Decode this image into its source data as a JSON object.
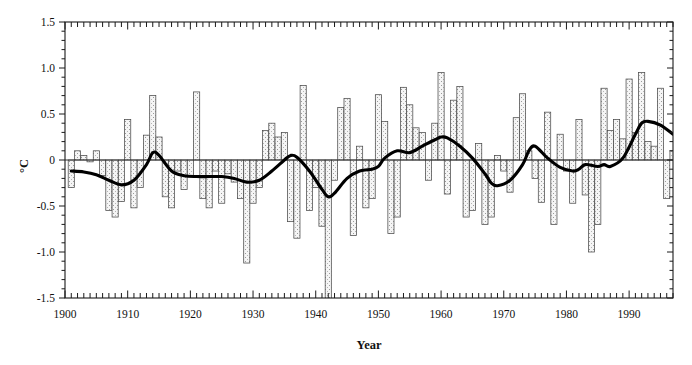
{
  "chart_data": {
    "type": "bar",
    "title": "",
    "subtitle": "",
    "xlabel": "Year",
    "ylabel": "°C",
    "xlim": [
      1900,
      1997
    ],
    "ylim": [
      -1.5,
      1.5
    ],
    "ytick_values": [
      -1.5,
      -1.0,
      -0.5,
      0,
      0.5,
      1.0,
      1.5
    ],
    "ytick_labels": [
      "-1.5",
      "-1.0",
      "-0.5",
      "0",
      "0.5",
      "1.0",
      "1.5"
    ],
    "xtick_values": [
      1900,
      1910,
      1920,
      1930,
      1940,
      1950,
      1960,
      1970,
      1980,
      1990
    ],
    "xtick_labels": [
      "1900",
      "1910",
      "1920",
      "1930",
      "1940",
      "1950",
      "1960",
      "1970",
      "1980",
      "1990"
    ],
    "minor_x_tick_interval": 1,
    "minor_y_tick_interval": 0.1,
    "grid": false,
    "legend": null,
    "zero_reference_line": 0,
    "bar_fill": "#f2f2f2",
    "bar_stipple": "#8a8a8a",
    "bar_edge": "#4a4a4a",
    "smooth_line_color": "#000000",
    "categories": [
      1901,
      1902,
      1903,
      1904,
      1905,
      1906,
      1907,
      1908,
      1909,
      1910,
      1911,
      1912,
      1913,
      1914,
      1915,
      1916,
      1917,
      1918,
      1919,
      1920,
      1921,
      1922,
      1923,
      1924,
      1925,
      1926,
      1927,
      1928,
      1929,
      1930,
      1931,
      1932,
      1933,
      1934,
      1935,
      1936,
      1937,
      1938,
      1939,
      1940,
      1941,
      1942,
      1943,
      1944,
      1945,
      1946,
      1947,
      1948,
      1949,
      1950,
      1951,
      1952,
      1953,
      1954,
      1955,
      1956,
      1957,
      1958,
      1959,
      1960,
      1961,
      1962,
      1963,
      1964,
      1965,
      1966,
      1967,
      1968,
      1969,
      1970,
      1971,
      1972,
      1973,
      1974,
      1975,
      1976,
      1977,
      1978,
      1979,
      1980,
      1981,
      1982,
      1983,
      1984,
      1985,
      1986,
      1987,
      1988,
      1989,
      1990,
      1991,
      1992,
      1993,
      1994,
      1995,
      1996,
      1997
    ],
    "values": [
      -0.3,
      0.1,
      0.05,
      -0.02,
      0.1,
      -0.17,
      -0.55,
      -0.62,
      -0.45,
      0.44,
      -0.52,
      -0.3,
      0.27,
      0.7,
      0.25,
      -0.4,
      -0.52,
      -0.12,
      -0.32,
      -0.17,
      0.74,
      -0.42,
      -0.52,
      -0.12,
      -0.47,
      -0.15,
      -0.24,
      -0.42,
      -1.12,
      -0.47,
      -0.3,
      0.32,
      0.4,
      0.25,
      0.3,
      -0.67,
      -0.85,
      0.81,
      -0.55,
      -0.3,
      -0.72,
      -1.62,
      -0.22,
      0.57,
      0.67,
      -0.82,
      0.15,
      -0.52,
      -0.42,
      0.71,
      0.42,
      -0.8,
      -0.62,
      0.79,
      0.6,
      0.35,
      0.3,
      -0.22,
      0.4,
      0.95,
      -0.37,
      0.65,
      0.8,
      -0.62,
      -0.55,
      0.18,
      -0.7,
      -0.62,
      0.05,
      -0.12,
      -0.35,
      0.46,
      0.72,
      0.1,
      -0.2,
      -0.46,
      0.52,
      -0.7,
      0.28,
      -0.12,
      -0.47,
      0.44,
      -0.38,
      -1.0,
      -0.7,
      0.78,
      0.32,
      0.44,
      0.23,
      0.88,
      0.3,
      0.95,
      0.2,
      0.15,
      0.78,
      -0.42,
      0.1
    ],
    "smoothed_series": {
      "name": "Smoothed trend",
      "x": [
        1901,
        1903,
        1905,
        1907,
        1909,
        1911,
        1913,
        1914,
        1915,
        1917,
        1919,
        1921,
        1923,
        1925,
        1927,
        1929,
        1931,
        1933,
        1935,
        1936,
        1937,
        1939,
        1941,
        1942,
        1943,
        1945,
        1947,
        1949,
        1950,
        1951,
        1953,
        1955,
        1957,
        1959,
        1960,
        1961,
        1963,
        1965,
        1967,
        1968,
        1969,
        1971,
        1973,
        1974,
        1975,
        1977,
        1979,
        1981,
        1982,
        1983,
        1985,
        1986,
        1987,
        1989,
        1991,
        1992,
        1993,
        1995,
        1997
      ],
      "y": [
        -0.12,
        -0.13,
        -0.16,
        -0.22,
        -0.27,
        -0.22,
        -0.05,
        0.08,
        0.05,
        -0.12,
        -0.17,
        -0.18,
        -0.18,
        -0.18,
        -0.2,
        -0.24,
        -0.22,
        -0.12,
        0.0,
        0.05,
        0.03,
        -0.12,
        -0.32,
        -0.4,
        -0.36,
        -0.2,
        -0.12,
        -0.1,
        -0.07,
        0.02,
        0.1,
        0.08,
        0.15,
        0.22,
        0.25,
        0.24,
        0.15,
        0.02,
        -0.15,
        -0.25,
        -0.28,
        -0.22,
        -0.05,
        0.1,
        0.15,
        0.02,
        -0.08,
        -0.12,
        -0.1,
        -0.05,
        -0.07,
        -0.05,
        -0.07,
        0.02,
        0.28,
        0.4,
        0.42,
        0.38,
        0.28
      ]
    }
  },
  "axes": {
    "y_title": "°C",
    "x_title": "Year"
  }
}
